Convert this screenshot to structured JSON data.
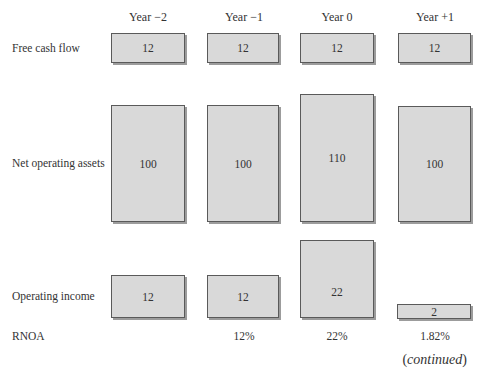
{
  "columns": [
    {
      "header": "Year −2",
      "left": 111
    },
    {
      "header": "Year −1",
      "left": 207
    },
    {
      "header": "Year 0",
      "left": 300
    },
    {
      "header": "Year +1",
      "left": 398
    }
  ],
  "rows": {
    "free_cash_flow": {
      "label": "Free cash flow",
      "values": [
        "12",
        "12",
        "12",
        "12"
      ]
    },
    "net_operating_assets": {
      "label": "Net operating assets",
      "values": [
        "100",
        "100",
        "110",
        "100"
      ]
    },
    "operating_income": {
      "label": "Operating income",
      "values": [
        "12",
        "12",
        "22",
        "2"
      ]
    },
    "rnoa": {
      "label": "RNOA",
      "values": [
        "",
        "12%",
        "22%",
        "1.82%"
      ]
    }
  },
  "footer": {
    "continued_open": "(",
    "continued_text": "continued",
    "continued_close": ")"
  },
  "colors": {
    "box_fill": "#d9d9d9",
    "box_border": "#5a5a5a",
    "box_shadow": "#9c9c9c",
    "text": "#333333"
  }
}
